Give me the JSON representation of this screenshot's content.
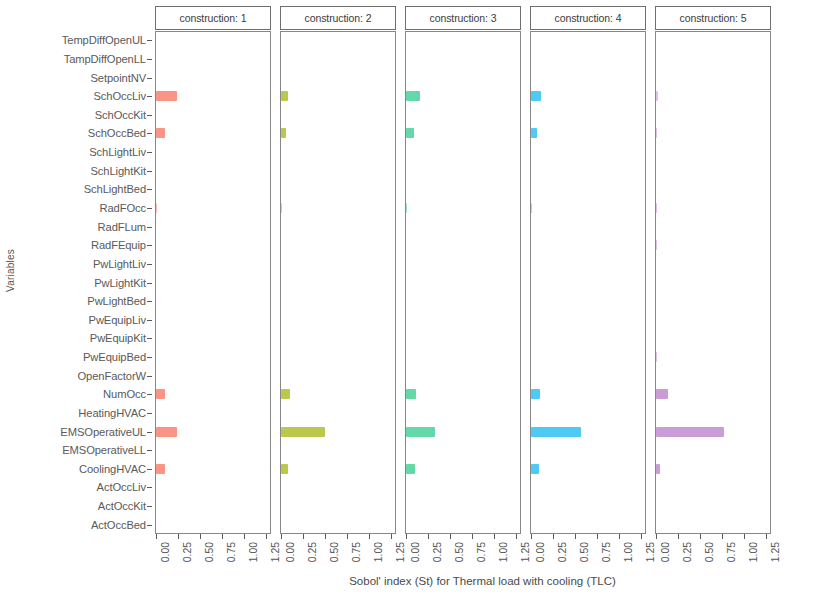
{
  "chart_data": {
    "type": "bar",
    "title": "",
    "xlabel": "Sobol' index (St) for Thermal load with cooling (TLC)",
    "ylabel": "Variables",
    "orientation": "horizontal",
    "grid": false,
    "legend": "none",
    "facet_variable": "construction",
    "xlim": [
      0,
      1.3
    ],
    "xticks": [
      0.0,
      0.25,
      0.5,
      0.75,
      1.0,
      1.25
    ],
    "xtick_labels": [
      "0.00",
      "0.25",
      "0.50",
      "0.75",
      "1.00",
      "1.25"
    ],
    "categories": [
      "TempDiffOpenUL",
      "TampDiffOpenLL",
      "SetpointNV",
      "SchOccLiv",
      "SchOccKit",
      "SchOccBed",
      "SchLightLiv",
      "SchLightKit",
      "SchLightBed",
      "RadFOcc",
      "RadFLum",
      "RadFEquip",
      "PwLightLiv",
      "PwLightKit",
      "PwLightBed",
      "PwEquipLiv",
      "PwEquipKit",
      "PwEquipBed",
      "OpenFactorW",
      "NumOcc",
      "HeatingHVAC",
      "EMSOperativeUL",
      "EMSOperativeLL",
      "CoolingHVAC",
      "ActOccLiv",
      "ActOccKit",
      "ActOccBed"
    ],
    "panels": [
      {
        "label": "construction: 1",
        "facet_value": "1",
        "color": "#fa8573",
        "values": [
          0,
          0,
          0,
          0.235,
          0,
          0.105,
          0,
          0,
          0,
          0.004,
          0,
          0,
          0,
          0,
          0,
          0,
          0,
          0,
          0,
          0.1,
          0,
          0.245,
          0,
          0.105,
          0,
          0,
          0
        ]
      },
      {
        "label": "construction: 2",
        "facet_value": "2",
        "color": "#b3c032",
        "values": [
          0,
          0,
          0,
          0.075,
          0,
          0.058,
          0,
          0,
          0,
          0.004,
          0,
          0,
          0,
          0,
          0,
          0,
          0,
          0,
          0,
          0.105,
          0,
          0.5,
          0,
          0.075,
          0,
          0,
          0
        ]
      },
      {
        "label": "construction: 3",
        "facet_value": "3",
        "color": "#4fd39c",
        "values": [
          0,
          0,
          0,
          0.165,
          0,
          0.095,
          0,
          0,
          0,
          0.004,
          0,
          0,
          0,
          0,
          0,
          0,
          0,
          0,
          0,
          0.115,
          0,
          0.33,
          0,
          0.1,
          0,
          0,
          0
        ]
      },
      {
        "label": "construction: 4",
        "facet_value": "4",
        "color": "#35c3f3",
        "values": [
          0,
          0,
          0,
          0.115,
          0,
          0.065,
          0,
          0,
          0,
          0.012,
          0,
          0,
          0,
          0,
          0,
          0,
          0,
          0,
          0,
          0.1,
          0,
          0.575,
          0,
          0.095,
          0,
          0,
          0
        ]
      },
      {
        "label": "construction: 5",
        "facet_value": "5",
        "color": "#c490d1",
        "values": [
          0,
          0,
          0,
          0.018,
          0,
          0.014,
          0,
          0,
          0,
          0.004,
          0,
          0.012,
          0,
          0,
          0,
          0,
          0,
          0.012,
          0,
          0.135,
          0,
          0.78,
          0,
          0.042,
          0,
          0,
          0
        ]
      }
    ]
  }
}
